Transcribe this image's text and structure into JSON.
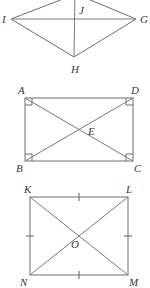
{
  "figures": [
    {
      "id": "figure-kite-ijgh",
      "name": "kite-ijgh",
      "labels": {
        "left": "I",
        "top": "J",
        "right": "G",
        "bottom": "H"
      }
    },
    {
      "id": "figure-rectangle-abcd",
      "name": "rectangle-abcd",
      "labels": {
        "top_left": "A",
        "top_right": "D",
        "bottom_left": "B",
        "bottom_right": "C",
        "center": "E"
      }
    },
    {
      "id": "figure-square-klmn",
      "name": "square-klmn",
      "labels": {
        "top_left": "K",
        "top_right": "L",
        "bottom_left": "N",
        "bottom_right": "M",
        "center": "O"
      }
    }
  ],
  "style": {
    "line_color": "#6e6e6e",
    "label_color": "#3a3a3a",
    "background_color": "#ffffff"
  }
}
